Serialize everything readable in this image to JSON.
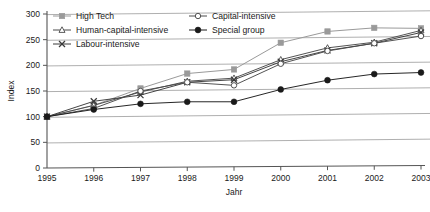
{
  "chart_data": {
    "type": "line",
    "title": "",
    "xlabel": "Jahr",
    "ylabel": "Index",
    "x": [
      1995,
      1996,
      1997,
      1998,
      1999,
      2000,
      2001,
      2002,
      2003
    ],
    "xtick_labels": [
      "1995",
      "1996",
      "1997",
      "1998",
      "1999",
      "2000",
      "2001",
      "2002",
      "2003"
    ],
    "ytick_labels": [
      "0",
      "50",
      "100",
      "150",
      "200",
      "250",
      "300"
    ],
    "yticks": [
      0,
      50,
      100,
      150,
      200,
      250,
      300
    ],
    "ylim": [
      0,
      300
    ],
    "grid": true,
    "grid_axis": "y",
    "legend_position": "top-inside",
    "series": [
      {
        "name": "High Tech",
        "marker": "filled-square",
        "color": "#9a9a9a",
        "values": [
          100,
          122,
          155,
          184,
          192,
          244,
          266,
          273,
          272
        ]
      },
      {
        "name": "Human-capital-intensive",
        "marker": "open-triangle",
        "color": "#4a4a4a",
        "values": [
          100,
          122,
          148,
          169,
          175,
          211,
          234,
          245,
          268
        ]
      },
      {
        "name": "Labour-intensive",
        "marker": "cross-x",
        "color": "#3a3a3a",
        "values": [
          100,
          130,
          142,
          167,
          172,
          207,
          229,
          243,
          264
        ]
      },
      {
        "name": "Capital-intensive",
        "marker": "open-circle",
        "color": "#4a4a4a",
        "values": [
          100,
          116,
          150,
          167,
          161,
          203,
          228,
          243,
          257
        ]
      },
      {
        "name": "Special group",
        "marker": "filled-circle",
        "color": "#1a1a1a",
        "values": [
          100,
          114,
          125,
          129,
          129,
          153,
          171,
          183,
          186
        ]
      }
    ]
  },
  "legend": {
    "entries": [
      {
        "label": "High Tech"
      },
      {
        "label": "Capital-intensive"
      },
      {
        "label": "Human-capital-intensive"
      },
      {
        "label": "Special group"
      },
      {
        "label": "Labour-intensive"
      }
    ]
  },
  "colors": {
    "axis": "#555555",
    "grid": "#8c8c8c",
    "background": "#ffffff",
    "high_tech": "#9a9a9a",
    "dark_line": "#3f3f3f"
  }
}
